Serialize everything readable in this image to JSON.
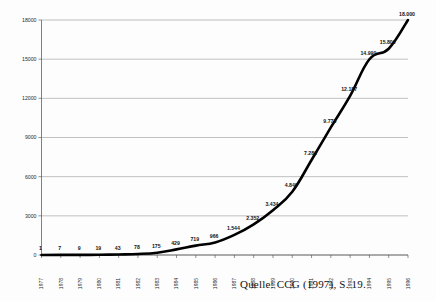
{
  "caption": "Quelle: CCG (1997), S. 19.",
  "chart_data": {
    "type": "line",
    "title": "",
    "xlabel": "",
    "ylabel": "",
    "categories": [
      "1977",
      "1978",
      "1979",
      "1980",
      "1981",
      "1982",
      "1983",
      "1984",
      "1985",
      "1986",
      "1987",
      "1988",
      "1989",
      "1990",
      "1991",
      "1992",
      "1993",
      "1994",
      "1995",
      "1996"
    ],
    "values": [
      1,
      7,
      9,
      19,
      43,
      78,
      175,
      429,
      719,
      966,
      1544,
      2352,
      3434,
      4849,
      7280,
      9773,
      12187,
      14990,
      15800,
      18000
    ],
    "point_labels": [
      "1",
      "7",
      "9",
      "19",
      "43",
      "78",
      "175",
      "429",
      "719",
      "966",
      "1.544",
      "2.352",
      "3.434",
      "4.849",
      "7.280",
      "9.773",
      "12.187",
      "14.990",
      "15.800",
      "18.000"
    ],
    "ylim": [
      0,
      18000
    ],
    "yticks": [
      0,
      3000,
      6000,
      9000,
      12000,
      15000,
      18000
    ],
    "ytick_labels": [
      "0",
      "3000",
      "6000",
      "9000",
      "12000",
      "15000",
      "18000"
    ],
    "grid": true,
    "legend": "none",
    "line_color": "#000000"
  }
}
